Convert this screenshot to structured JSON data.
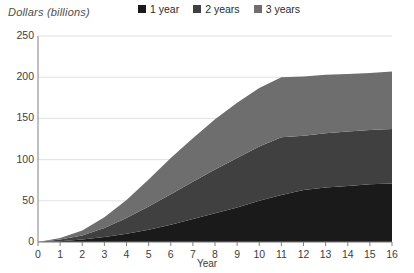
{
  "chart_data": {
    "type": "area",
    "stacked": true,
    "title": "",
    "xlabel": "Year",
    "ylabel": "Dollars (billions)",
    "xlim": [
      0,
      16
    ],
    "ylim": [
      0,
      250
    ],
    "grid": true,
    "legend_position": "top-center",
    "x": [
      0,
      1,
      2,
      3,
      4,
      5,
      6,
      7,
      8,
      9,
      10,
      11,
      12,
      13,
      14,
      15,
      16
    ],
    "xticklabels": [
      "0",
      "1",
      "2",
      "3",
      "4",
      "5",
      "6",
      "7",
      "8",
      "9",
      "10",
      "11",
      "12",
      "13",
      "14",
      "15",
      "16"
    ],
    "yticklabels": [
      "0",
      "50",
      "100",
      "150",
      "200",
      "250"
    ],
    "yticks": [
      0,
      50,
      100,
      150,
      200,
      250
    ],
    "series": [
      {
        "name": "1 year",
        "color": "#1a1a1a",
        "values": [
          0,
          1,
          3,
          6,
          10,
          15,
          21,
          28,
          35,
          42,
          50,
          57,
          63,
          66,
          68,
          70,
          71
        ]
      },
      {
        "name": "2 years",
        "color": "#404040",
        "values": [
          0,
          2,
          5,
          11,
          19,
          28,
          37,
          45,
          53,
          60,
          66,
          70,
          66,
          66,
          66,
          66,
          66
        ]
      },
      {
        "name": "3 years",
        "color": "#6e6e6e",
        "values": [
          0,
          2,
          6,
          13,
          22,
          33,
          44,
          53,
          61,
          67,
          71,
          73,
          72,
          71,
          70,
          69,
          70
        ]
      }
    ],
    "totals": [
      0,
      5,
      14,
      30,
      51,
      76,
      102,
      126,
      149,
      169,
      187,
      200,
      201,
      203,
      204,
      205,
      207
    ]
  },
  "legend": {
    "items": [
      {
        "label": "1 year",
        "color": "#1a1a1a"
      },
      {
        "label": "2 years",
        "color": "#404040"
      },
      {
        "label": "3 years",
        "color": "#6e6e6e"
      }
    ]
  },
  "axes": {
    "y_title": "Dollars (billions)",
    "x_title": "Year"
  },
  "colors": {
    "gridline": "#d9d9d9",
    "axis": "#808080",
    "background": "#ffffff",
    "text": "#3d3d3d"
  }
}
